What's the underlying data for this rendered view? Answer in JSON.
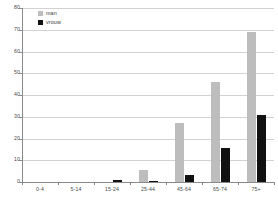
{
  "chart_data": {
    "type": "bar",
    "title": "",
    "subtitle": "",
    "xlabel": "",
    "ylabel": "",
    "categories": [
      "0-4",
      "5-14",
      "15-24",
      "25-44",
      "45-64",
      "65-74",
      "75+"
    ],
    "series": [
      {
        "name": "man",
        "color": "#bdbdbd",
        "values": [
          0,
          0,
          0,
          5.5,
          27,
          46,
          69
        ]
      },
      {
        "name": "vrouw",
        "color": "#111111",
        "values": [
          0,
          0,
          0.7,
          0.4,
          3,
          15.5,
          31
        ]
      }
    ],
    "ylim": [
      0,
      80
    ],
    "yticks": [
      0,
      10,
      20,
      30,
      40,
      50,
      60,
      70,
      80
    ],
    "ytick_labels": [
      "0",
      "10",
      "20",
      "30",
      "40",
      "50",
      "60",
      "70",
      "80"
    ],
    "grid": true,
    "grid_axis": "y",
    "legend_position": "top-left",
    "legend": [
      "man",
      "vrouw"
    ]
  },
  "legend": {
    "items": [
      {
        "label": "man",
        "swatch": "legend-swatch-man"
      },
      {
        "label": "vrouw",
        "swatch": "legend-swatch-vrouw"
      }
    ]
  },
  "colors": {
    "man": "#bdbdbd",
    "vrouw": "#111111",
    "grid": "#d2d2d2",
    "axis": "#8a8a8a",
    "text": "#4a4a4a",
    "background": "#ffffff"
  }
}
